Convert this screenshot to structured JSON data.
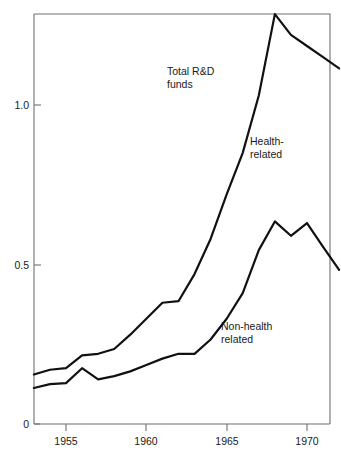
{
  "chart_data": {
    "type": "line",
    "title": "",
    "subtitle": "",
    "xlabel": "",
    "ylabel": "",
    "xlim": [
      1953,
      1972
    ],
    "ylim": [
      0,
      1.32
    ],
    "grid": false,
    "legend_position": "inline-annotations",
    "x": [
      1953,
      1954,
      1955,
      1956,
      1957,
      1958,
      1959,
      1960,
      1961,
      1962,
      1963,
      1964,
      1965,
      1966,
      1967,
      1968,
      1969,
      1970,
      1971,
      1972
    ],
    "xtick_labels": [
      "1955",
      "1960",
      "1965",
      "1970"
    ],
    "xtick_values": [
      1955,
      1960,
      1965,
      1970
    ],
    "ytick_labels": [
      "0",
      "0.5",
      "1.0"
    ],
    "ytick_values": [
      0,
      0.5,
      1.0
    ],
    "series": [
      {
        "name": "Total R&D funds",
        "values": [
          0.155,
          0.17,
          0.175,
          0.215,
          0.22,
          0.235,
          0.28,
          0.33,
          0.38,
          0.385,
          0.47,
          0.58,
          0.72,
          0.85,
          1.03,
          1.285,
          1.22,
          1.185,
          1.15,
          1.115
        ]
      },
      {
        "name": "Non-health related",
        "values": [
          0.113,
          0.125,
          0.128,
          0.175,
          0.14,
          0.15,
          0.165,
          0.185,
          0.205,
          0.22,
          0.22,
          0.265,
          0.33,
          0.41,
          0.545,
          0.635,
          0.59,
          0.63,
          0.555,
          0.483
        ]
      }
    ],
    "annotations": [
      {
        "id": "total-rd",
        "lines": [
          "Total R&D",
          "funds"
        ],
        "x_px": 167,
        "y_px": 75
      },
      {
        "id": "health-related",
        "lines": [
          "Health-",
          "related"
        ],
        "x_px": 250,
        "y_px": 145
      },
      {
        "id": "non-health-related",
        "lines": [
          "Non-health",
          "related"
        ],
        "x_px": 221,
        "y_px": 330
      }
    ],
    "colors": {
      "line": "#111111",
      "axis": "#6f6f6f",
      "text": "#1a1a1a",
      "background": "#ffffff"
    }
  },
  "labels": {
    "total_rd_line1": "Total R&D",
    "total_rd_line2": "funds",
    "health_line1": "Health-",
    "health_line2": "related",
    "nonhealth_line1": "Non-health",
    "nonhealth_line2": "related",
    "ytick_0": "0",
    "ytick_05": "0.5",
    "ytick_10": "1.0",
    "xtick_1955": "1955",
    "xtick_1960": "1960",
    "xtick_1965": "1965",
    "xtick_1970": "1970"
  }
}
